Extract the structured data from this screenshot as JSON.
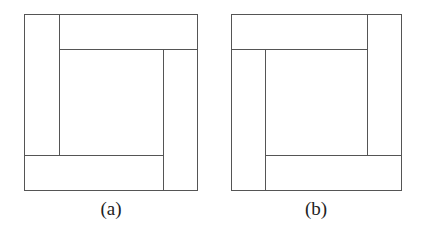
{
  "figures": [
    {
      "id": "a",
      "caption": "(a)",
      "description": "Square divided into four rectangles arranged in a clockwise pinwheel around a central square"
    },
    {
      "id": "b",
      "caption": "(b)",
      "description": "Square divided into four rectangles arranged in a counter-clockwise pinwheel around a central square"
    }
  ],
  "colors": {
    "line": "#555555",
    "background": "#ffffff"
  }
}
